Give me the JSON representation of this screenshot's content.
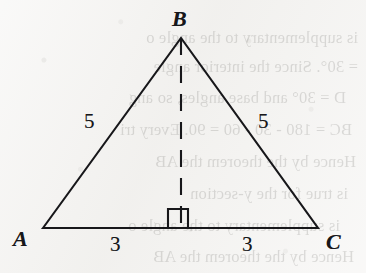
{
  "figure": {
    "kind": "isosceles-triangle-with-altitude",
    "caption": "",
    "background_color": "#f3f2f0",
    "ink_color": "#17171a",
    "vertices": [
      {
        "id": "A",
        "label": "A",
        "x": 43,
        "y": 228
      },
      {
        "id": "B",
        "label": "B",
        "x": 181,
        "y": 38
      },
      {
        "id": "C",
        "label": "C",
        "x": 318,
        "y": 228
      }
    ],
    "foot": {
      "id": "D",
      "label": "",
      "x": 181,
      "y": 228
    },
    "side_labels": {
      "left_leg": "5",
      "right_leg": "5",
      "left_base": "3",
      "right_base": "3"
    },
    "altitude": {
      "style": "dashed",
      "from": "B",
      "to": "D",
      "right_angle_marked": true
    },
    "right_angle_marker": {
      "name": "right-angle-square",
      "size": 20,
      "left": 168,
      "top": 209
    }
  },
  "bleed_through_text": {
    "note": "faint mirrored show-through from reverse page",
    "lines": [
      "is supplementary to the angle o",
      "= 30°. Since the interior angle",
      "D = 30° and base angles, so ang",
      "BC = 180 - 30 - 60 = 90. Every tri",
      "Hence by the theorem the AB",
      "is true for the y-section"
    ]
  }
}
